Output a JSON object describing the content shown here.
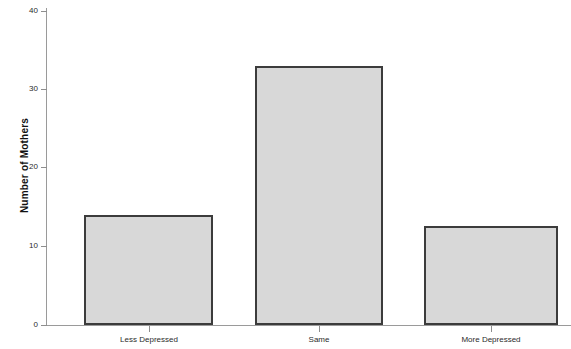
{
  "chart_data": {
    "type": "bar",
    "title": "",
    "subtitle": "",
    "xlabel": "",
    "ylabel": "Number of Mothers",
    "categories": [
      "Less Depressed",
      "Same",
      "More Depressed"
    ],
    "values": [
      14,
      33,
      12.6
    ],
    "ylim": [
      0,
      42
    ],
    "y_ticks": [
      0,
      10,
      20,
      30,
      40
    ],
    "y_tick_labels": [
      "0",
      "10",
      "20",
      "30",
      "40"
    ],
    "grid": false,
    "legend": null,
    "legend_position": "none",
    "colors": {
      "bar_fill": "#d8d8d8",
      "bar_border": "#3c3c3c",
      "axis": "#9a9a9a",
      "text": "#2b2b2b",
      "background": "#ffffff"
    }
  },
  "axis": {
    "y_title": "Number of Mothers",
    "tick_0": "0",
    "tick_10": "10",
    "tick_20": "20",
    "tick_30": "30",
    "tick_40": "40"
  },
  "bars": [
    {
      "label": "Less Depressed",
      "value": "14"
    },
    {
      "label": "Same",
      "value": "33"
    },
    {
      "label": "More Depressed",
      "value": "12.6"
    }
  ]
}
